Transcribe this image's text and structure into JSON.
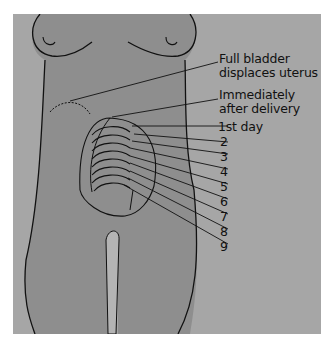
{
  "figure": {
    "colors": {
      "background": "#a6a6a6",
      "body": "#8e8e8e",
      "outline": "#111111",
      "page": "#ffffff"
    },
    "labels": {
      "full_bladder_line1": "Full bladder",
      "full_bladder_line2": "displaces uterus",
      "immediately_line1": "Immediately",
      "immediately_line2": "after delivery",
      "day1": "1st day",
      "days": [
        "2",
        "3",
        "4",
        "5",
        "6",
        "7",
        "8",
        "9"
      ]
    }
  }
}
